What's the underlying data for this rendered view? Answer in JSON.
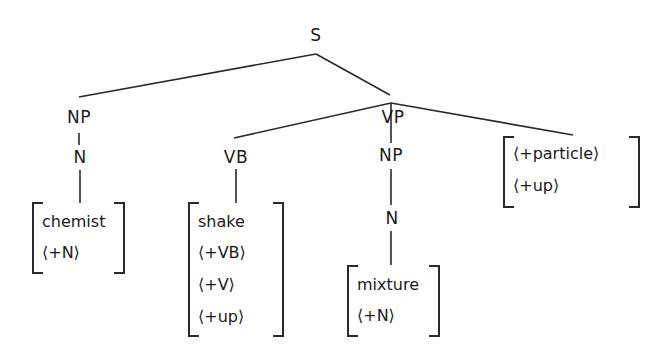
{
  "tree": {
    "nodes": {
      "s": "S",
      "np_subject": "NP",
      "vp": "VP",
      "n_subject": "N",
      "vb": "VB",
      "np_object": "NP",
      "n_object": "N"
    },
    "lexical_entries": {
      "chemist": [
        "chemist",
        "⟨+N⟩"
      ],
      "shake": [
        "shake",
        "⟨+VB⟩",
        "⟨+V⟩",
        "⟨+up⟩"
      ],
      "mixture": [
        "mixture",
        "⟨+N⟩"
      ],
      "particle": [
        "⟨+particle⟩",
        "⟨+up⟩"
      ]
    }
  }
}
